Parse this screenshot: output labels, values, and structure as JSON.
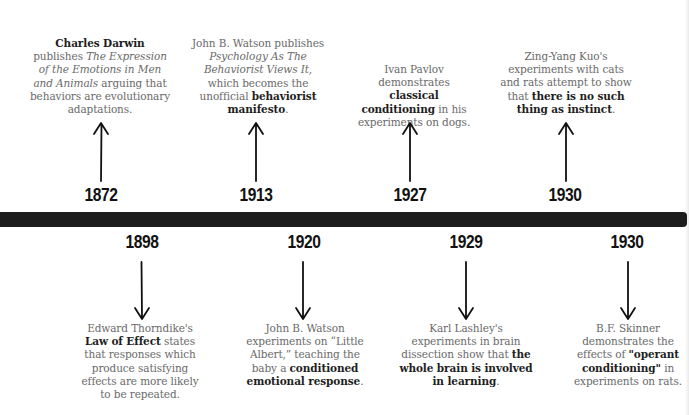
{
  "timeline": {
    "bar_color": "#1d1d1d",
    "top_events": [
      {
        "year": "1872",
        "parts": [
          {
            "t": "Charles Darwin",
            "s": "b"
          },
          {
            "t": " publishes ",
            "s": "n"
          },
          {
            "t": "The Expression of the Emotions in Men and Animals",
            "s": "i"
          },
          {
            "t": " arguing that behaviors are evolutionary adaptations.",
            "s": "n"
          }
        ]
      },
      {
        "year": "1913",
        "parts": [
          {
            "t": "John B. Watson publishes ",
            "s": "n"
          },
          {
            "t": "Psychology As The Behaviorist Views It",
            "s": "i"
          },
          {
            "t": ", which becomes the unofficial ",
            "s": "n"
          },
          {
            "t": "behaviorist manifesto",
            "s": "b"
          },
          {
            "t": ".",
            "s": "n"
          }
        ]
      },
      {
        "year": "1927",
        "parts": [
          {
            "t": "Ivan Pavlov demonstrates ",
            "s": "n"
          },
          {
            "t": "classical conditioning",
            "s": "b"
          },
          {
            "t": " in his experiments on dogs.",
            "s": "n"
          }
        ]
      },
      {
        "year": "1930",
        "parts": [
          {
            "t": "Zing-Yang Kuo's experiments with cats and rats attempt to show that ",
            "s": "n"
          },
          {
            "t": "there is no such thing as instinct",
            "s": "b"
          },
          {
            "t": ".",
            "s": "n"
          }
        ]
      }
    ],
    "bottom_events": [
      {
        "year": "1898",
        "parts": [
          {
            "t": "Edward Thorndike's ",
            "s": "n"
          },
          {
            "t": "Law of Effect",
            "s": "b"
          },
          {
            "t": " states that responses which produce satisfying effects are more likely to be repeated.",
            "s": "n"
          }
        ]
      },
      {
        "year": "1920",
        "parts": [
          {
            "t": "John B. Watson experiments on “Little Albert,” teaching the baby a ",
            "s": "n"
          },
          {
            "t": "conditioned emotional response",
            "s": "b"
          },
          {
            "t": ".",
            "s": "n"
          }
        ]
      },
      {
        "year": "1929",
        "parts": [
          {
            "t": "Karl Lashley's experiments in brain dissection show that ",
            "s": "n"
          },
          {
            "t": "the whole brain is involved in learning",
            "s": "b"
          },
          {
            "t": ".",
            "s": "n"
          }
        ]
      },
      {
        "year": "1930",
        "parts": [
          {
            "t": "B.F. Skinner demonstrates the effects of ",
            "s": "n"
          },
          {
            "t": "\"operant conditioning\"",
            "s": "b"
          },
          {
            "t": " in experiments on rats.",
            "s": "n"
          }
        ]
      }
    ]
  }
}
